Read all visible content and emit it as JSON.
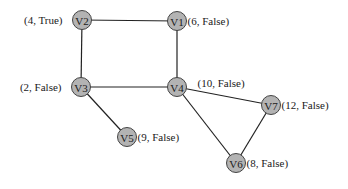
{
  "diagram": {
    "type": "graph",
    "nodes": [
      {
        "id": "V1",
        "label": "V1",
        "annotation": "(6, False)"
      },
      {
        "id": "V2",
        "label": "V2",
        "annotation": "(4, True)"
      },
      {
        "id": "V3",
        "label": "V3",
        "annotation": "(2, False)"
      },
      {
        "id": "V4",
        "label": "V4",
        "annotation": "(10, False)"
      },
      {
        "id": "V5",
        "label": "V5",
        "annotation": "(9, False)"
      },
      {
        "id": "V6",
        "label": "V6",
        "annotation": "(8, False)"
      },
      {
        "id": "V7",
        "label": "V7",
        "annotation": "(12, False)"
      }
    ],
    "edges": [
      {
        "from": "V2",
        "to": "V1"
      },
      {
        "from": "V2",
        "to": "V3"
      },
      {
        "from": "V1",
        "to": "V4"
      },
      {
        "from": "V3",
        "to": "V4"
      },
      {
        "from": "V3",
        "to": "V5"
      },
      {
        "from": "V4",
        "to": "V7"
      },
      {
        "from": "V4",
        "to": "V6"
      },
      {
        "from": "V7",
        "to": "V6"
      }
    ],
    "colors": {
      "node_fill": "#b3b3b3",
      "node_stroke": "#444444",
      "edge": "#222222",
      "text": "#1a1a1a"
    }
  }
}
